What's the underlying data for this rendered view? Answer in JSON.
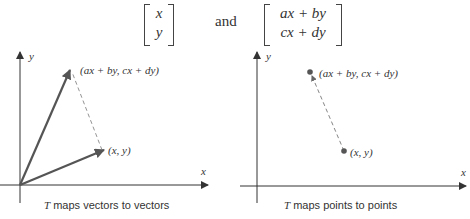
{
  "header": {
    "vector_left": [
      "x",
      "y"
    ],
    "conjunction": "and",
    "vector_right": [
      "ax + by",
      "cx + dy"
    ]
  },
  "left_panel": {
    "axis_x": "x",
    "axis_y": "y",
    "label_image": "(ax + by, cx + dy)",
    "label_point": "(x, y)",
    "caption_T": "T",
    "caption_rest": " maps vectors to vectors"
  },
  "right_panel": {
    "axis_x": "x",
    "axis_y": "y",
    "label_image": "(ax + by, cx + dy)",
    "label_point": "(x, y)",
    "caption_T": "T",
    "caption_rest": " maps points to points"
  },
  "colors": {
    "vector": "#555555",
    "axis": "#333333",
    "dashed": "#666666"
  }
}
